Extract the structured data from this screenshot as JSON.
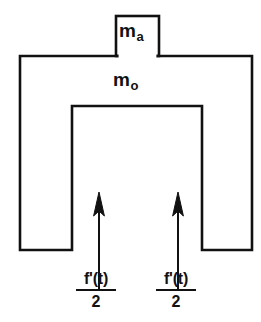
{
  "figure": {
    "type": "mechanical-schematic",
    "width": 261,
    "height": 322,
    "background_color": "#ffffff",
    "stroke_color": "#111111",
    "text_color": "#111111",
    "labels": {
      "actuator_mass": {
        "symbol": "m",
        "subscript": "a"
      },
      "main_mass": {
        "symbol": "m",
        "subscript": "o"
      }
    },
    "force_labels": [
      {
        "numerator": "f'(t)",
        "denominator": "2"
      },
      {
        "numerator": "f'(t)",
        "denominator": "2"
      }
    ],
    "arrows": [
      {
        "name": "left-force-arrow",
        "direction": "up"
      },
      {
        "name": "right-force-arrow",
        "direction": "up"
      }
    ]
  }
}
